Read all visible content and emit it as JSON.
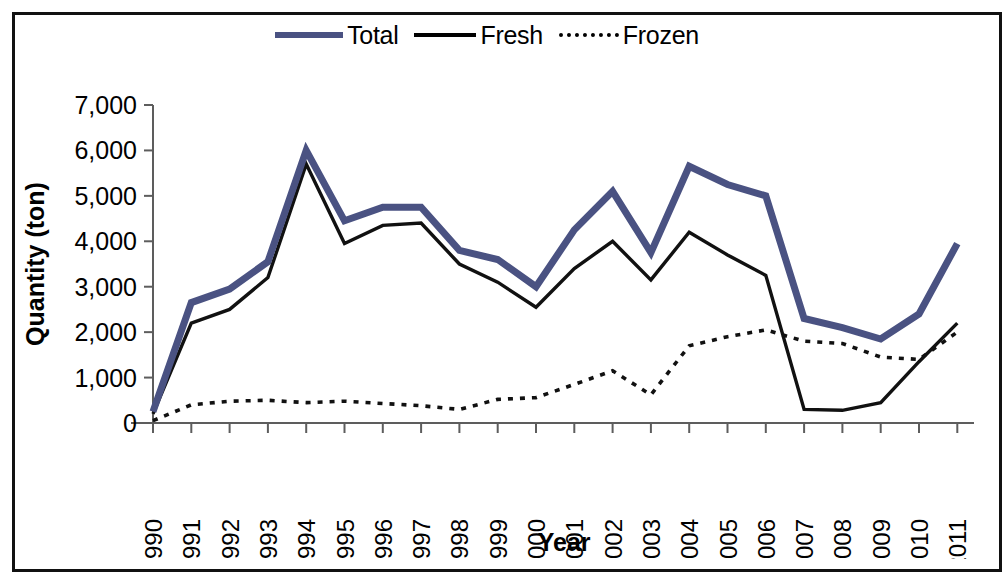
{
  "legend": {
    "position": "top-center",
    "entries": [
      {
        "label": "Total",
        "icon": "thick-line-swatch",
        "color": "#4a5282"
      },
      {
        "label": "Fresh",
        "icon": "solid-line-swatch",
        "color": "#000000"
      },
      {
        "label": "Frozen",
        "icon": "dotted-line-swatch",
        "color": "#000000"
      }
    ]
  },
  "axes": {
    "y_title": "Quantity (ton)",
    "x_title": "Year",
    "y_ticks": [
      "0",
      "1,000",
      "2,000",
      "3,000",
      "4,000",
      "5,000",
      "6,000",
      "7,000"
    ]
  },
  "chart_data": {
    "type": "line",
    "title": "",
    "subtitle": "",
    "xlabel": "Year",
    "ylabel": "Quantity (ton)",
    "ylim": [
      0,
      7000
    ],
    "ytick_step": 1000,
    "grid": false,
    "legend_position": "top-center",
    "categories": [
      "1990",
      "1991",
      "1992",
      "1993",
      "1994",
      "1995",
      "1996",
      "1997",
      "1998",
      "1999",
      "2000",
      "2001",
      "2002",
      "2003",
      "2004",
      "2005",
      "2006",
      "2007",
      "2008",
      "2009",
      "2010",
      "2011"
    ],
    "series": [
      {
        "name": "Total",
        "color": "#4a5282",
        "style": "thick-solid",
        "values": [
          250,
          2650,
          2950,
          3550,
          6000,
          4450,
          4750,
          4750,
          3800,
          3600,
          3000,
          4250,
          5100,
          3750,
          5650,
          5250,
          5000,
          2300,
          2100,
          1850,
          2400,
          3950
        ]
      },
      {
        "name": "Fresh",
        "color": "#111111",
        "style": "solid",
        "values": [
          200,
          2200,
          2500,
          3200,
          5700,
          3950,
          4350,
          4400,
          3500,
          3100,
          2550,
          3400,
          4000,
          3150,
          4200,
          3700,
          3250,
          300,
          280,
          450,
          1350,
          2200
        ]
      },
      {
        "name": "Frozen",
        "color": "#111111",
        "style": "dotted",
        "values": [
          50,
          400,
          480,
          500,
          450,
          480,
          430,
          380,
          300,
          520,
          560,
          850,
          1150,
          620,
          1700,
          1900,
          2050,
          1800,
          1750,
          1450,
          1400,
          2000
        ]
      }
    ]
  }
}
